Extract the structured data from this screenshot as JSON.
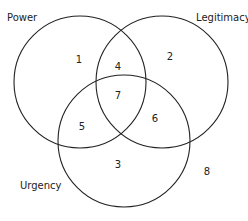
{
  "diagram": {
    "type": "venn",
    "sets": [
      {
        "name": "Power",
        "cx": 80,
        "cy": 82,
        "r": 66,
        "label_x": 7,
        "label_y": 13
      },
      {
        "name": "Legitimacy",
        "cx": 162,
        "cy": 82,
        "r": 66,
        "label_x": 196,
        "label_y": 13
      },
      {
        "name": "Urgency",
        "cx": 124,
        "cy": 141,
        "r": 66,
        "label_x": 20,
        "label_y": 181
      }
    ],
    "regions": [
      {
        "id": "1",
        "label": "1",
        "sets": [
          "Power"
        ],
        "x": 79,
        "y": 60
      },
      {
        "id": "2",
        "label": "2",
        "sets": [
          "Legitimacy"
        ],
        "x": 170,
        "y": 57
      },
      {
        "id": "3",
        "label": "3",
        "sets": [
          "Urgency"
        ],
        "x": 118,
        "y": 165
      },
      {
        "id": "4",
        "label": "4",
        "sets": [
          "Power",
          "Legitimacy"
        ],
        "x": 118,
        "y": 67
      },
      {
        "id": "5",
        "label": "5",
        "sets": [
          "Power",
          "Urgency"
        ],
        "x": 82,
        "y": 127
      },
      {
        "id": "6",
        "label": "6",
        "sets": [
          "Legitimacy",
          "Urgency"
        ],
        "x": 155,
        "y": 119
      },
      {
        "id": "7",
        "label": "7",
        "sets": [
          "Power",
          "Legitimacy",
          "Urgency"
        ],
        "x": 118,
        "y": 96
      },
      {
        "id": "8",
        "label": "8",
        "sets": [],
        "x": 207,
        "y": 172
      }
    ],
    "stroke_color": "#222222"
  }
}
